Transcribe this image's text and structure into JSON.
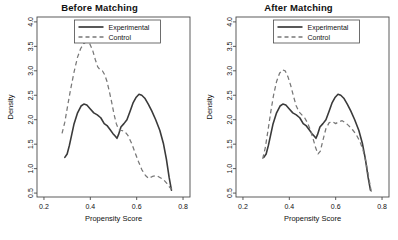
{
  "figure": {
    "panel_count": 2
  },
  "chart_data": [
    {
      "type": "line",
      "title": "Before Matching",
      "xlabel": "Propensity Score",
      "ylabel": "Density",
      "xlim": [
        0.17,
        0.83
      ],
      "ylim": [
        0.42,
        4.1
      ],
      "xticks": [
        0.2,
        0.4,
        0.6,
        0.8
      ],
      "xtick_labels": [
        "0.2",
        "0.4",
        "0.6",
        "0.8"
      ],
      "yticks": [
        0.5,
        1.0,
        1.5,
        2.0,
        2.5,
        3.0,
        3.5,
        4.0
      ],
      "ytick_labels": [
        "0.5",
        "1.0",
        "1.5",
        "2.0",
        "2.5",
        "3.0",
        "3.5",
        "4.0"
      ],
      "grid": false,
      "legend_position": "top-center",
      "legend": [
        "Experimental",
        "Control"
      ],
      "series": [
        {
          "name": "Experimental",
          "style": "solid",
          "color": "#3a3a3a",
          "x": [
            0.29,
            0.3,
            0.31,
            0.32,
            0.33,
            0.345,
            0.36,
            0.372,
            0.385,
            0.4,
            0.415,
            0.43,
            0.445,
            0.46,
            0.472,
            0.485,
            0.497,
            0.508,
            0.515,
            0.522,
            0.532,
            0.545,
            0.558,
            0.572,
            0.585,
            0.598,
            0.61,
            0.622,
            0.635,
            0.65,
            0.665,
            0.682,
            0.7,
            0.715,
            0.728,
            0.74,
            0.75
          ],
          "y": [
            1.23,
            1.3,
            1.48,
            1.7,
            1.92,
            2.14,
            2.28,
            2.32,
            2.3,
            2.22,
            2.14,
            2.1,
            2.04,
            1.92,
            1.88,
            1.8,
            1.72,
            1.66,
            1.62,
            1.7,
            1.85,
            1.92,
            2.0,
            2.18,
            2.35,
            2.46,
            2.52,
            2.5,
            2.44,
            2.32,
            2.18,
            2.0,
            1.78,
            1.52,
            1.2,
            0.82,
            0.56
          ]
        },
        {
          "name": "Control",
          "style": "dashed",
          "color": "#777777",
          "x": [
            0.278,
            0.29,
            0.302,
            0.315,
            0.33,
            0.345,
            0.358,
            0.372,
            0.385,
            0.398,
            0.41,
            0.422,
            0.432,
            0.442,
            0.452,
            0.462,
            0.472,
            0.482,
            0.492,
            0.502,
            0.512,
            0.522,
            0.535,
            0.548,
            0.562,
            0.578,
            0.592,
            0.608,
            0.622,
            0.638,
            0.652,
            0.668,
            0.685,
            0.7,
            0.715,
            0.73,
            0.742,
            0.752
          ],
          "y": [
            1.72,
            1.95,
            2.28,
            2.62,
            2.98,
            3.28,
            3.45,
            3.56,
            3.6,
            3.55,
            3.42,
            3.22,
            3.08,
            3.02,
            3.0,
            2.92,
            2.78,
            2.58,
            2.36,
            2.12,
            1.92,
            1.8,
            1.78,
            1.76,
            1.68,
            1.52,
            1.34,
            1.14,
            0.98,
            0.86,
            0.8,
            0.84,
            0.86,
            0.82,
            0.78,
            0.7,
            0.62,
            0.58
          ]
        }
      ]
    },
    {
      "type": "line",
      "title": "After Matching",
      "xlabel": "Propensity Score",
      "ylabel": "Density",
      "xlim": [
        0.17,
        0.83
      ],
      "ylim": [
        0.42,
        4.1
      ],
      "xticks": [
        0.2,
        0.4,
        0.6,
        0.8
      ],
      "xtick_labels": [
        "0.2",
        "0.4",
        "0.6",
        "0.8"
      ],
      "yticks": [
        0.5,
        1.0,
        1.5,
        2.0,
        2.5,
        3.0,
        3.5,
        4.0
      ],
      "ytick_labels": [
        "0.5",
        "1.0",
        "1.5",
        "2.0",
        "2.5",
        "3.0",
        "3.5",
        "4.0"
      ],
      "grid": false,
      "legend_position": "top-center",
      "legend": [
        "Experimental",
        "Control"
      ],
      "series": [
        {
          "name": "Experimental",
          "style": "solid",
          "color": "#3a3a3a",
          "x": [
            0.29,
            0.3,
            0.31,
            0.32,
            0.33,
            0.345,
            0.36,
            0.372,
            0.385,
            0.4,
            0.415,
            0.43,
            0.445,
            0.46,
            0.472,
            0.485,
            0.497,
            0.508,
            0.515,
            0.522,
            0.532,
            0.545,
            0.558,
            0.572,
            0.585,
            0.598,
            0.61,
            0.622,
            0.635,
            0.65,
            0.665,
            0.682,
            0.7,
            0.715,
            0.728,
            0.74,
            0.75
          ],
          "y": [
            1.23,
            1.3,
            1.48,
            1.7,
            1.92,
            2.14,
            2.28,
            2.32,
            2.3,
            2.22,
            2.14,
            2.1,
            2.04,
            1.92,
            1.88,
            1.8,
            1.72,
            1.66,
            1.62,
            1.7,
            1.85,
            1.92,
            2.0,
            2.18,
            2.35,
            2.46,
            2.52,
            2.5,
            2.44,
            2.32,
            2.18,
            2.0,
            1.78,
            1.52,
            1.2,
            0.82,
            0.56
          ]
        },
        {
          "name": "Control",
          "style": "dashed",
          "color": "#777777",
          "x": [
            0.285,
            0.296,
            0.308,
            0.32,
            0.332,
            0.345,
            0.358,
            0.37,
            0.382,
            0.394,
            0.406,
            0.418,
            0.43,
            0.442,
            0.454,
            0.466,
            0.478,
            0.49,
            0.502,
            0.514,
            0.524,
            0.534,
            0.546,
            0.558,
            0.572,
            0.586,
            0.6,
            0.614,
            0.628,
            0.642,
            0.656,
            0.672,
            0.688,
            0.704,
            0.718,
            0.732,
            0.744,
            0.754
          ],
          "y": [
            1.2,
            1.42,
            1.78,
            2.16,
            2.5,
            2.78,
            2.95,
            3.02,
            3.0,
            2.88,
            2.7,
            2.48,
            2.28,
            2.16,
            2.1,
            2.04,
            1.94,
            1.8,
            1.62,
            1.42,
            1.3,
            1.36,
            1.6,
            1.82,
            1.94,
            1.96,
            1.92,
            1.96,
            1.98,
            1.94,
            1.88,
            1.8,
            1.7,
            1.56,
            1.38,
            1.1,
            0.78,
            0.52
          ]
        }
      ]
    }
  ]
}
